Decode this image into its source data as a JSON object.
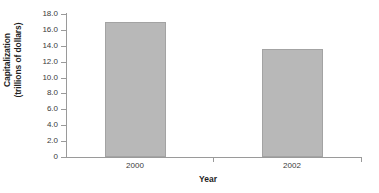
{
  "chart_data": {
    "type": "bar",
    "title": "",
    "subtitle": "",
    "categories": [
      "2000",
      "2002"
    ],
    "values": [
      17.0,
      13.6
    ],
    "series": [
      {
        "name": "Capitalization",
        "values": [
          17.0,
          13.6
        ]
      }
    ],
    "xlabel": "Year",
    "ylabel_line1": "Capitalization",
    "ylabel_line2": "(trillions of dollars)",
    "ylabel": "Capitalization (trillions of dollars)",
    "ylim": [
      0,
      18.0
    ],
    "ytick_values": [
      18.0,
      16.0,
      14.0,
      12.0,
      10.0,
      8.0,
      6.0,
      4.0,
      2.0,
      0
    ],
    "ytick_labels": [
      "18.0",
      "16.0",
      "14.0",
      "12.0",
      "10.0",
      "8.0",
      "6.0",
      "4.0",
      "2.0",
      "0"
    ],
    "grid": false,
    "legend": false,
    "legend_position": "none",
    "bar_color": "#b8b8b8",
    "bar_border_color": "#a3a3a3",
    "axis_color": "#9a9a9a",
    "background_color": "#ffffff",
    "text_color": "#2b2b2b"
  }
}
